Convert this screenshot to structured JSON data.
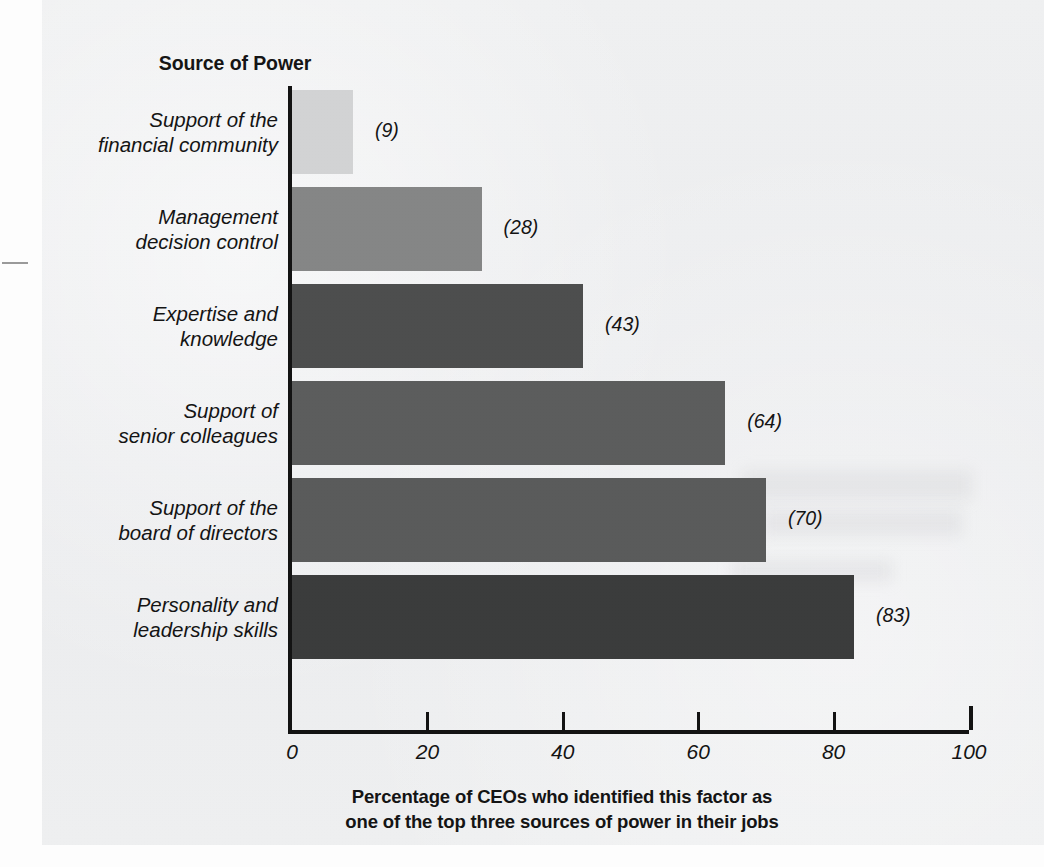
{
  "colors": {
    "panel_background": "#eeeff0",
    "axis": "#131313",
    "text": "#141414"
  },
  "axis_title": "Source of Power",
  "caption_lines": [
    "Percentage of CEOs who identified this factor as",
    "one of the top three sources of power in their jobs"
  ],
  "chart_data": {
    "type": "bar",
    "orientation": "horizontal",
    "title": "Source of Power",
    "xlabel": "Percentage of CEOs who identified this factor as one of the top three sources of power in their jobs",
    "ylabel": "Source of Power",
    "xlim": [
      0,
      100
    ],
    "grid": false,
    "legend": false,
    "xticks": [
      "0",
      "20",
      "40",
      "60",
      "80",
      "100"
    ],
    "xtick_values": [
      0,
      20,
      40,
      60,
      80,
      100
    ],
    "categories": [
      "Support of the financial community",
      "Management decision control",
      "Expertise and knowledge",
      "Support of senior colleagues",
      "Support of the board of directors",
      "Personality and leadership skills"
    ],
    "values": [
      9,
      28,
      43,
      64,
      70,
      83
    ],
    "value_labels": [
      "(9)",
      "(28)",
      "(43)",
      "(64)",
      "(70)",
      "(83)"
    ],
    "bar_colors": [
      "#d2d3d4",
      "#858686",
      "#4d4e4e",
      "#5c5d5d",
      "#5a5b5b",
      "#3b3c3c"
    ]
  },
  "bars": [
    {
      "label_line1": "Support of the",
      "label_line2": "financial community",
      "value": 9,
      "value_label": "(9)",
      "color": "#d2d3d4"
    },
    {
      "label_line1": "Management",
      "label_line2": "decision control",
      "value": 28,
      "value_label": "(28)",
      "color": "#858686"
    },
    {
      "label_line1": "Expertise and",
      "label_line2": "knowledge",
      "value": 43,
      "value_label": "(43)",
      "color": "#4d4e4e"
    },
    {
      "label_line1": "Support of",
      "label_line2": "senior colleagues",
      "value": 64,
      "value_label": "(64)",
      "color": "#5c5d5d"
    },
    {
      "label_line1": "Support of the",
      "label_line2": "board of directors",
      "value": 70,
      "value_label": "(70)",
      "color": "#5a5b5b"
    },
    {
      "label_line1": "Personality and",
      "label_line2": "leadership skills",
      "value": 83,
      "value_label": "(83)",
      "color": "#3b3c3c"
    }
  ],
  "xticks": [
    {
      "label": "0",
      "value": 0
    },
    {
      "label": "20",
      "value": 20
    },
    {
      "label": "40",
      "value": 40
    },
    {
      "label": "60",
      "value": 60
    },
    {
      "label": "80",
      "value": 80
    },
    {
      "label": "100",
      "value": 100
    }
  ]
}
